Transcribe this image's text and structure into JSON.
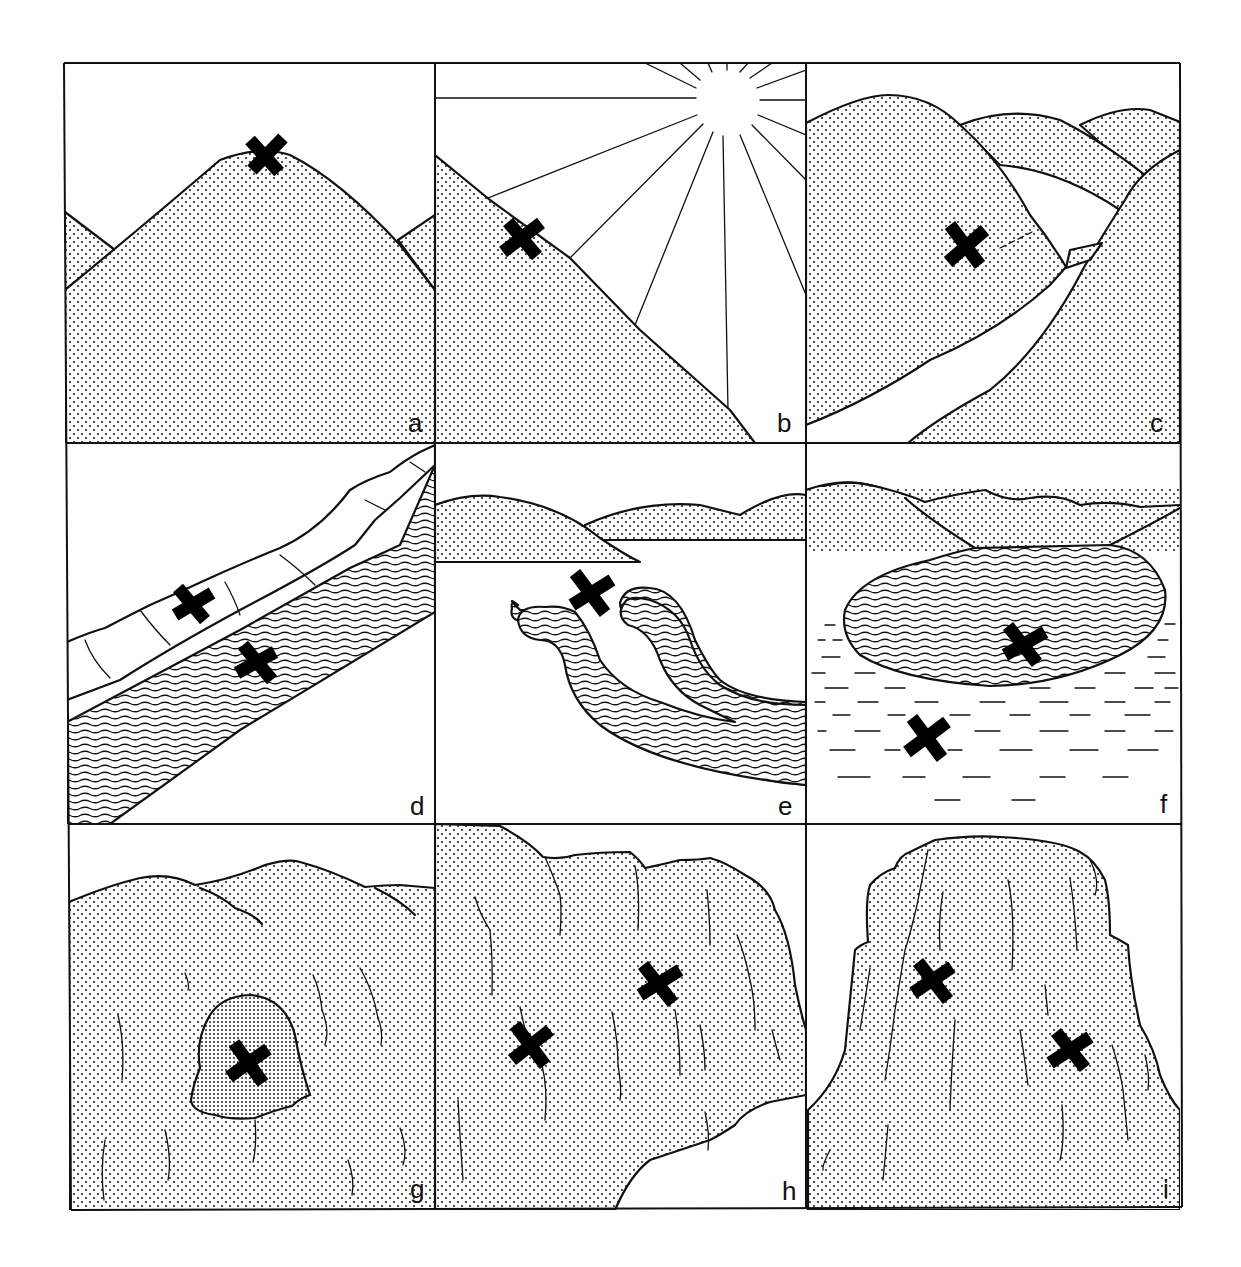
{
  "figure": {
    "panels": [
      {
        "id": "a",
        "label": "a",
        "scene": "rounded hilltop summit",
        "markers": 1
      },
      {
        "id": "b",
        "label": "b",
        "scene": "sun-facing mountain slope with sun rays",
        "markers": 1
      },
      {
        "id": "c",
        "label": "c",
        "scene": "hillside above a river valley",
        "markers": 1
      },
      {
        "id": "d",
        "label": "d",
        "scene": "cliff bank beside a river",
        "markers": 2
      },
      {
        "id": "e",
        "label": "e",
        "scene": "river meander loops below hills",
        "markers": 1
      },
      {
        "id": "f",
        "label": "f",
        "scene": "lake with surrounding marsh",
        "markers": 2
      },
      {
        "id": "g",
        "label": "g",
        "scene": "cave entrance in rock face",
        "markers": 1
      },
      {
        "id": "h",
        "label": "h",
        "scene": "rock face with overhangs",
        "markers": 2
      },
      {
        "id": "i",
        "label": "i",
        "scene": "isolated rock butte",
        "markers": 2
      }
    ]
  },
  "colors": {
    "ink": "#111111",
    "background": "#ffffff"
  }
}
